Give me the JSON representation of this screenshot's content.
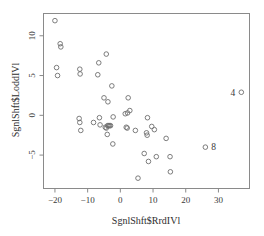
{
  "chart_data": {
    "type": "scatter",
    "title": "",
    "xlabel": "SgnlShft$RrdIVl",
    "ylabel": "SgnlShft$LoddIVl",
    "xlim": [
      -23.5,
      39.5
    ],
    "ylim": [
      -9.2,
      12.8
    ],
    "xticks": [
      -20,
      -10,
      0,
      10,
      20,
      30
    ],
    "xticklabels": [
      "-20",
      "-10",
      "0",
      "10",
      "20",
      "30"
    ],
    "yticks": [
      -5,
      0,
      5,
      10
    ],
    "yticklabels": [
      "-5",
      "0",
      "5",
      "10"
    ],
    "grid": false,
    "legend": null,
    "marker": "open-circle",
    "points": [
      {
        "x": -20.0,
        "y": 11.9
      },
      {
        "x": -18.4,
        "y": 9.0
      },
      {
        "x": -18.2,
        "y": 8.6
      },
      {
        "x": -19.5,
        "y": 6.0
      },
      {
        "x": -19.2,
        "y": 5.0
      },
      {
        "x": -12.4,
        "y": 5.8
      },
      {
        "x": -12.3,
        "y": 5.2
      },
      {
        "x": -6.6,
        "y": 6.6
      },
      {
        "x": -6.9,
        "y": 5.1
      },
      {
        "x": -4.3,
        "y": 7.7
      },
      {
        "x": -2.6,
        "y": 3.7
      },
      {
        "x": -5.0,
        "y": 2.2
      },
      {
        "x": -3.8,
        "y": 1.7
      },
      {
        "x": 2.4,
        "y": 2.2
      },
      {
        "x": -12.6,
        "y": -0.4
      },
      {
        "x": -12.4,
        "y": -0.9
      },
      {
        "x": -12.1,
        "y": -1.9
      },
      {
        "x": -8.2,
        "y": -0.9
      },
      {
        "x": -6.4,
        "y": -0.3
      },
      {
        "x": -6.2,
        "y": -1.2
      },
      {
        "x": -4.6,
        "y": -1.5
      },
      {
        "x": -4.3,
        "y": -1.6
      },
      {
        "x": -3.9,
        "y": -1.3
      },
      {
        "x": -3.6,
        "y": -1.3
      },
      {
        "x": -3.3,
        "y": -1.3
      },
      {
        "x": -3.0,
        "y": -1.3
      },
      {
        "x": -2.2,
        "y": -0.2
      },
      {
        "x": -4.0,
        "y": -2.4
      },
      {
        "x": -2.3,
        "y": -3.6
      },
      {
        "x": 1.5,
        "y": 0.2
      },
      {
        "x": 2.2,
        "y": 0.3
      },
      {
        "x": 2.9,
        "y": 0.6
      },
      {
        "x": 1.8,
        "y": -1.5
      },
      {
        "x": 2.1,
        "y": -1.6
      },
      {
        "x": 4.6,
        "y": -1.9
      },
      {
        "x": 8.3,
        "y": -0.3
      },
      {
        "x": 9.6,
        "y": -1.4
      },
      {
        "x": 10.4,
        "y": -1.8
      },
      {
        "x": 8.0,
        "y": -2.2
      },
      {
        "x": 8.2,
        "y": -2.5
      },
      {
        "x": 14.0,
        "y": -2.9
      },
      {
        "x": 7.3,
        "y": -4.8
      },
      {
        "x": 8.6,
        "y": -5.8
      },
      {
        "x": 11.0,
        "y": -5.2
      },
      {
        "x": 15.2,
        "y": -5.2
      },
      {
        "x": 5.4,
        "y": -7.9
      },
      {
        "x": 15.3,
        "y": -7.1
      }
    ],
    "labeled_points": [
      {
        "x": 37.0,
        "y": 2.9,
        "label": "4",
        "label_side": "left"
      },
      {
        "x": 26.0,
        "y": -4.0,
        "label": "8",
        "label_side": "right"
      }
    ]
  }
}
